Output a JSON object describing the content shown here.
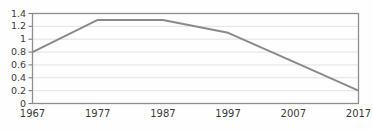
{
  "chart_data": {
    "type": "line",
    "title": "",
    "subtitle": "",
    "xlabel": "",
    "ylabel": "",
    "x": [
      1967,
      1977,
      1987,
      1997,
      2007,
      2017
    ],
    "categories": [
      "1967",
      "1977",
      "1987",
      "1997",
      "2007",
      "2017"
    ],
    "series": [
      {
        "name": "series-1",
        "values": [
          0.8,
          1.3,
          1.3,
          1.1,
          0.65,
          0.2
        ],
        "color": "#8a8a8a"
      }
    ],
    "xlim": [
      1967,
      2017
    ],
    "ylim": [
      0,
      1.4
    ],
    "ytick_values": [
      0,
      0.2,
      0.4,
      0.6,
      0.8,
      1,
      1.2,
      1.4
    ],
    "ytick_labels": [
      "0",
      "0.2",
      "0.4",
      "0.6",
      "0.8",
      "1",
      "1.2",
      "1.4"
    ],
    "xtick_values": [
      1967,
      1977,
      1987,
      1997,
      2007,
      2017
    ],
    "xtick_labels": [
      "1967",
      "1977",
      "1987",
      "1997",
      "2007",
      "2017"
    ],
    "grid": "horizontal",
    "legend": "none",
    "annotations": []
  },
  "style": {
    "background_color": "#fefefe",
    "grid_color": "#dcdcdc",
    "frame_color": "#8e8e8e",
    "tick_color": "#7d7d7d",
    "label_color": "#3a3a3a",
    "line_color": "#8a8a8a"
  }
}
